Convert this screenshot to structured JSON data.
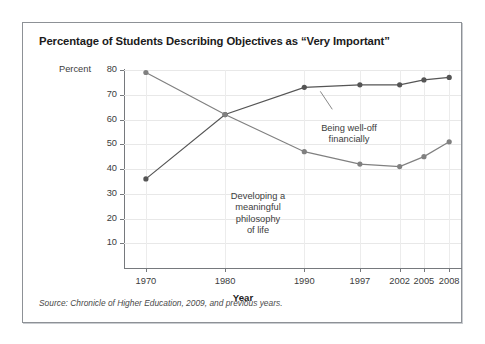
{
  "figure": {
    "title": "Percentage of Students Describing Objectives as “Very Important”",
    "source_note": "Source: Chronicle of Higher Education, 2009, and previous years.",
    "frame_color": "#8d9196",
    "background": "#ffffff"
  },
  "chart_data": {
    "type": "line",
    "title": "Percentage of Students Describing Objectives as “Very Important”",
    "xlabel": "Year",
    "ylabel": "Percent",
    "categories": [
      "1970",
      "1980",
      "1990",
      "1997",
      "2002",
      "2005",
      "2008"
    ],
    "x": [
      1970,
      1980,
      1990,
      1997,
      2002,
      2005,
      2008
    ],
    "x_positions_pct": [
      6.5,
      30.0,
      53.5,
      70.0,
      81.8,
      89.0,
      96.5
    ],
    "ylim": [
      0,
      80
    ],
    "yticks": [
      10,
      20,
      30,
      40,
      50,
      60,
      70,
      80
    ],
    "ytick_labels": [
      "10",
      "20",
      "30",
      "40",
      "50",
      "60",
      "70",
      "80"
    ],
    "grid": "both",
    "legend": "annotations-inline",
    "series": [
      {
        "name": "Being well-off financially",
        "label": "Being well-off\nfinancially",
        "color": "#555555",
        "marker": "circle",
        "values": [
          36,
          62,
          73,
          74,
          74,
          76,
          77
        ]
      },
      {
        "name": "Developing a meaningful philosophy of life",
        "label": "Developing a\nmeaningful\nphilosophy\nof life",
        "color": "#808080",
        "marker": "circle",
        "values": [
          79,
          62,
          47,
          42,
          41,
          45,
          51
        ]
      }
    ],
    "annotations": [
      {
        "id": "being-well-off",
        "lines": [
          "Being well-off",
          "financially"
        ],
        "target_series": "Being well-off financially"
      },
      {
        "id": "developing-philosophy",
        "lines": [
          "Developing a",
          "meaningful",
          "philosophy",
          "of life"
        ],
        "target_series": "Developing a meaningful philosophy of life"
      }
    ]
  }
}
